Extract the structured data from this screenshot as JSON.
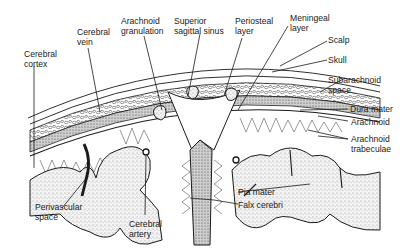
{
  "colors": {
    "ink": "#1a1a1a",
    "background": "#ffffff",
    "stipple": "#d9d9d9",
    "dura_fill": "#bdbdbd"
  },
  "labels": {
    "cerebral_cortex": "Cerebral\ncortex",
    "cerebral_vein": "Cerebral\nvein",
    "arachnoid_granulation": "Arachnoid\ngranulation",
    "superior_sagittal_sinus": "Superior\nsagittal sinus",
    "periosteal_layer": "Periosteal\nlayer",
    "meningeal_layer": "Meningeal\nlayer",
    "scalp": "Scalp",
    "skull": "Skull",
    "subarachnoid_space": "Subarachnoid\nspace",
    "dura_mater": "Dura mater",
    "arachnoid": "Arachnoid",
    "arachnoid_trabeculae": "Arachnoid\ntrabeculae",
    "perivascular_space": "Perivascular\nspace",
    "cerebral_artery": "Cerebral\nartery",
    "pia_mater": "Pia mater",
    "falx_cerebri": "Falx cerebri"
  }
}
